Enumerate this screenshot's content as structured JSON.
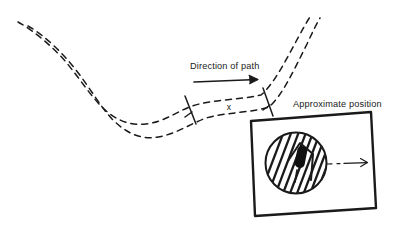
{
  "figure": {
    "kind": "hand-drawn-diagram",
    "background_color": "#ffffff",
    "ink_color": "#1a1a1a"
  },
  "labels": {
    "direction_of_path": "Direction of path",
    "approximate_position": "Approximate position",
    "position_marker": "x"
  },
  "icons": {
    "direction_arrow": "arrow-right-icon",
    "inset_arrow": "arrow-right-icon",
    "tick_left": "tick-mark-icon",
    "tick_right": "tick-mark-icon",
    "leader_line": "dashed-leader-icon"
  },
  "path_track": {
    "style": "dashed",
    "rail_count": 2,
    "dash_pattern": "6 5",
    "stroke_width": 1.5,
    "color": "#1a1a1a",
    "upper_rail_points": [
      [
        18,
        22
      ],
      [
        40,
        34
      ],
      [
        62,
        54
      ],
      [
        80,
        78
      ],
      [
        96,
        99
      ],
      [
        112,
        115
      ],
      [
        130,
        124
      ],
      [
        150,
        123
      ],
      [
        168,
        113
      ],
      [
        186,
        106
      ],
      [
        214,
        102
      ],
      [
        244,
        99
      ],
      [
        262,
        95
      ],
      [
        278,
        78
      ],
      [
        292,
        50
      ],
      [
        304,
        26
      ],
      [
        312,
        14
      ]
    ],
    "lower_rail_points": [
      [
        28,
        26
      ],
      [
        50,
        40
      ],
      [
        72,
        62
      ],
      [
        90,
        88
      ],
      [
        106,
        110
      ],
      [
        122,
        127
      ],
      [
        142,
        137
      ],
      [
        162,
        136
      ],
      [
        180,
        126
      ],
      [
        198,
        118
      ],
      [
        226,
        114
      ],
      [
        252,
        111
      ],
      [
        270,
        107
      ],
      [
        286,
        88
      ],
      [
        300,
        58
      ],
      [
        312,
        32
      ],
      [
        320,
        18
      ]
    ]
  },
  "segment_marks": {
    "left_tick": {
      "x1": 185,
      "y1": 96,
      "x2": 196,
      "y2": 124
    },
    "left_tick_cap": {
      "x1": 185,
      "y1": 118,
      "x2": 192,
      "y2": 113
    },
    "right_tick": {
      "x1": 263,
      "y1": 88,
      "x2": 273,
      "y2": 116
    },
    "right_tick_cap": {
      "x1": 263,
      "y1": 111,
      "x2": 269,
      "y2": 106
    },
    "label_position": {
      "x": 229,
      "y": 110
    }
  },
  "direction_arrow": {
    "x1": 194,
    "y1": 82,
    "x2": 258,
    "y2": 79,
    "head_length": 9,
    "stroke_width": 1.6
  },
  "inset_box": {
    "corners": [
      [
        251,
        121
      ],
      [
        371,
        112
      ],
      [
        376,
        208
      ],
      [
        255,
        216
      ]
    ],
    "stroke_width": 2.4,
    "fill": "#ffffff"
  },
  "inset_circle": {
    "cx": 296,
    "cy": 163,
    "r": 31,
    "stroke_width": 2.0
  },
  "inset_hatching": {
    "line_count": 11,
    "angle_deg": 65,
    "stroke_width": 2.2,
    "spacing": 6
  },
  "inset_marker": {
    "shape": "capsule",
    "cx": 301,
    "cy": 157,
    "width": 9,
    "height": 21,
    "rotation_deg": 12,
    "fill": "#111111"
  },
  "inset_chevron": {
    "points": "289,160 300,144 313,155 310,178",
    "stroke_width": 1.8
  },
  "inset_arrow": {
    "dash_x1": 326,
    "dash_y1": 164,
    "dash_x2": 342,
    "dash_y2": 163,
    "solid_x1": 345,
    "solid_y1": 163,
    "solid_x2": 368,
    "solid_y2": 162,
    "head_length": 7,
    "stroke_width": 1.2
  },
  "text_positions": {
    "direction_of_path": {
      "x": 190,
      "y": 69
    },
    "approximate_position": {
      "x": 293,
      "y": 107
    }
  }
}
